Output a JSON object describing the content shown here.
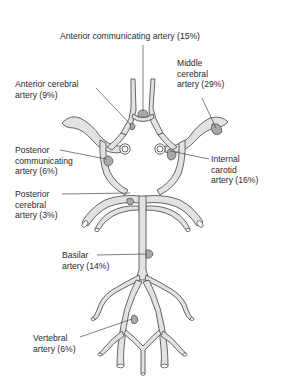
{
  "diagram": {
    "colors": {
      "vessel_fill": "#e2e2e2",
      "vessel_stroke": "#555555",
      "aneurysm_fill": "#a9a9a9",
      "text": "#2a2a2a",
      "background": "#ffffff"
    },
    "labels": [
      {
        "id": "acom",
        "lines": [
          "Anterior communicating artery (15%)"
        ],
        "percent": 15
      },
      {
        "id": "mca",
        "lines": [
          "Middle",
          "cerebral",
          "artery (29%)"
        ],
        "percent": 29
      },
      {
        "id": "aca",
        "lines": [
          "Anterior cerebral",
          "artery (9%)"
        ],
        "percent": 9
      },
      {
        "id": "pcom",
        "lines": [
          "Posterior",
          "communicating",
          "artery (6%)"
        ],
        "percent": 6
      },
      {
        "id": "ica",
        "lines": [
          "Internal",
          "carotid",
          "artery (16%)"
        ],
        "percent": 16
      },
      {
        "id": "pca",
        "lines": [
          "Posterior",
          "cerebral",
          "artery (3%)"
        ],
        "percent": 3
      },
      {
        "id": "basilar",
        "lines": [
          "Basilar",
          "artery (14%)"
        ],
        "percent": 14
      },
      {
        "id": "vertebral",
        "lines": [
          "Vertebral",
          "artery (6%)"
        ],
        "percent": 6
      }
    ],
    "text": {
      "acom": "Anterior communicating artery (15%)",
      "mca": "Middle\ncerebral\nartery (29%)",
      "aca": "Anterior cerebral\nartery (9%)",
      "pcom": "Posterior\ncommunicating\nartery (6%)",
      "ica": "Internal\ncarotid\nartery (16%)",
      "pca": "Posterior\ncerebral\nartery (3%)",
      "basilar": "Basilar\nartery (14%)",
      "vertebral": "Vertebral\nartery (6%)"
    }
  }
}
